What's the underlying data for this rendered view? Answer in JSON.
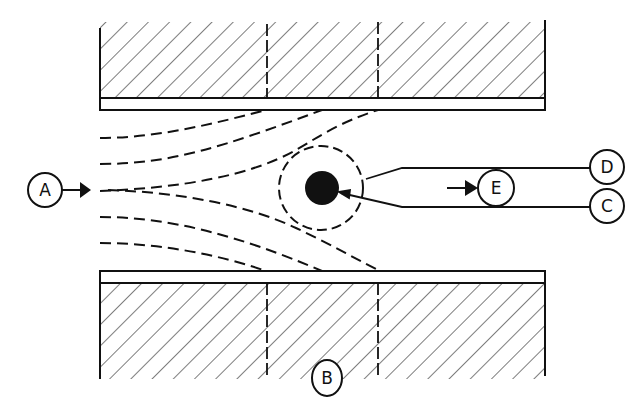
{
  "diagram": {
    "type": "schematic cross-section",
    "colors": {
      "ink": "#111111",
      "background": "#ffffff"
    },
    "labels": {
      "A": "A",
      "B": "B",
      "C": "C",
      "D": "D",
      "E": "E"
    },
    "elements": [
      {
        "id": "A",
        "role": "inlet flow arrow label",
        "position": "left, pointing right into channel"
      },
      {
        "id": "B",
        "role": "lower plate / wall label",
        "position": "below bottom plate"
      },
      {
        "id": "C",
        "role": "lower line of outlet channel leading to particle",
        "position": "right, lower"
      },
      {
        "id": "D",
        "role": "upper line of outlet channel",
        "position": "right, upper"
      },
      {
        "id": "E",
        "role": "outlet flow direction label",
        "position": "inside right channel, arrow pointing right"
      }
    ],
    "plates": {
      "top": {
        "segments": 3,
        "hatched": true
      },
      "bottom": {
        "segments": 3,
        "hatched": true
      }
    },
    "streamlines": {
      "count": 6,
      "style": "dashed"
    },
    "particle": {
      "core": "filled black circle",
      "boundary": "dashed circle"
    }
  }
}
